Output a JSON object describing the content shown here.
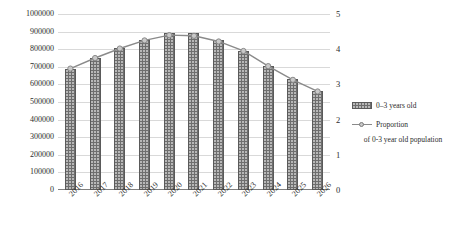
{
  "chart_data": {
    "type": "bar",
    "title": "",
    "xlabel": "",
    "ylabel": "Population",
    "y2label": "",
    "categories": [
      "2016",
      "2017",
      "2018",
      "2019",
      "2020",
      "2021",
      "2022",
      "2023",
      "2024",
      "2025",
      "2026"
    ],
    "ylim": [
      0,
      1000000
    ],
    "y2lim": [
      0,
      5
    ],
    "yticks": [
      "0",
      "100000",
      "200000",
      "300000",
      "400000",
      "500000",
      "600000",
      "700000",
      "800000",
      "900000",
      "1000000"
    ],
    "y2ticks": [
      "0",
      "1",
      "2",
      "3",
      "4",
      "5"
    ],
    "grid": true,
    "legend_position": "right",
    "series": [
      {
        "name": "0–3 years old",
        "type": "bar",
        "axis": "left",
        "values": [
          690000,
          750000,
          805000,
          850000,
          890000,
          890000,
          855000,
          790000,
          705000,
          630000,
          560000
        ]
      },
      {
        "name": "Proportion of 0-3 year old population",
        "type": "line",
        "axis": "right",
        "values": [
          3.45,
          3.75,
          4.02,
          4.25,
          4.4,
          4.38,
          4.22,
          3.95,
          3.52,
          3.13,
          2.8
        ]
      }
    ]
  },
  "axes": {
    "left_title": "Population",
    "left_ticks": [
      "1000000",
      "900000",
      "800000",
      "700000",
      "600000",
      "500000",
      "400000",
      "300000",
      "200000",
      "100000",
      "0"
    ],
    "right_ticks": [
      "5",
      "4",
      "3",
      "2",
      "1",
      "0"
    ],
    "x_ticks": [
      "2016",
      "2017",
      "2018",
      "2019",
      "2020",
      "2021",
      "2022",
      "2023",
      "2024",
      "2025",
      "2026"
    ]
  },
  "legend": {
    "bar_label": "0–3 years old",
    "line_label": "Proportion",
    "line_label_line2": "of 0-3 year old population"
  },
  "colors": {
    "bar_fill": "#6e6e6e",
    "bar_stroke": "#5a5a5a",
    "line": "#8a8a8a",
    "marker_fill": "#c9c9c9",
    "grid": "#d9d9d9",
    "axis": "#808080",
    "text": "#2b2b2b"
  }
}
